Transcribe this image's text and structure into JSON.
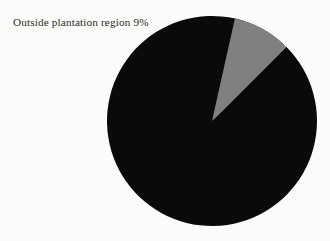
{
  "figure": {
    "background_color": "#fbfbfa",
    "width": 330,
    "height": 241
  },
  "annotation": {
    "label": "Outside plantation region 9%"
  },
  "chart_data": {
    "type": "pie",
    "title": "",
    "subtitle": "",
    "xlabel": "",
    "ylabel": "",
    "grid": false,
    "legend_position": "none",
    "labels": [
      "Plantation region",
      "Outside plantation region"
    ],
    "values": [
      91,
      9
    ],
    "units": "%",
    "data_labels": [
      "",
      "9%"
    ],
    "annotations": [
      "Outside plantation region 9%"
    ],
    "colors": [
      "#0a0a0a",
      "#808080"
    ],
    "slices": [
      {
        "name": "Plantation region",
        "value": 91,
        "label": "",
        "color": "#0a0a0a",
        "start_angle_deg": 315.0,
        "end_angle_deg": 672.6
      },
      {
        "name": "Outside plantation region",
        "value": 9,
        "label": "9%",
        "color": "#808080",
        "start_angle_deg": 282.6,
        "end_angle_deg": 315.0
      }
    ],
    "geometry": {
      "center_x": 212,
      "center_y": 121,
      "radius": 105
    }
  },
  "colors": {
    "primary_slice": "#0a0a0a",
    "secondary_slice": "#808080",
    "background": "#fbfbfa",
    "text": "#2b2b2b"
  }
}
